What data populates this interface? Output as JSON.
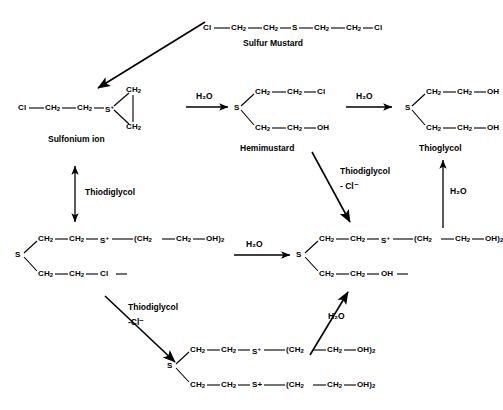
{
  "diagram": {
    "type": "reaction-scheme"
  },
  "species": {
    "sulfur_mustard": {
      "name": "Sulfur Mustard",
      "formula_line": "Cl—CH₂—CH₂—S—CH₂—CH₂—Cl",
      "atoms": [
        "Cl",
        "CH2",
        "CH2",
        "S",
        "CH2",
        "CH2",
        "Cl"
      ]
    },
    "sulfonium_ion": {
      "name": "Sulfonium ion",
      "chain": [
        "Cl",
        "CH2",
        "CH2",
        "S+"
      ],
      "ring": [
        "CH2",
        "CH2"
      ],
      "s_label": "S",
      "charge": "+"
    },
    "hemimustard": {
      "name": "Hemimustard",
      "center": "S",
      "top_branch": [
        "CH2",
        "CH2",
        "Cl"
      ],
      "bottom_branch": [
        "CH2",
        "CH2",
        "OH"
      ]
    },
    "thioglycol": {
      "name": "Thioglycol",
      "center": "S",
      "top_branch": [
        "CH2",
        "CH2",
        "OH"
      ],
      "bottom_branch": [
        "CH2",
        "CH2",
        "OH"
      ]
    },
    "chloro_sulfonium_adduct": {
      "name": "",
      "center": "S",
      "top_branch": [
        "CH2",
        "CH2",
        "S+",
        "(CH2",
        "CH2",
        "OH)2"
      ],
      "bottom_branch": [
        "CH2",
        "CH2",
        "Cl"
      ]
    },
    "hydroxy_sulfonium_adduct": {
      "name": "",
      "center": "S",
      "top_branch": [
        "CH2",
        "CH2",
        "S+",
        "(CH2",
        "CH2",
        "OH)2"
      ],
      "bottom_branch": [
        "CH2",
        "CH2",
        "OH"
      ]
    },
    "bis_sulfonium_adduct": {
      "name": "",
      "center": "S",
      "top_branch": [
        "CH2",
        "CH2",
        "S+",
        "(CH2",
        "CH2",
        "OH)2"
      ],
      "bottom_branch": [
        "CH2",
        "CH2",
        "S+",
        "(CH2",
        "CH2",
        "OH)2"
      ]
    }
  },
  "reagents": {
    "water": "H₂O",
    "thiodiglycol": "Thiodiglycol",
    "minus_chloride": "- Cl⁻",
    "minus_chloride_tight": "-Cl⁻"
  },
  "arrows": [
    {
      "id": "mustard-to-sulfonium",
      "label": "",
      "direction": "down-left",
      "style": "solid"
    },
    {
      "id": "sulfonium-to-hemimustard",
      "label": "H₂O",
      "direction": "right",
      "style": "solid"
    },
    {
      "id": "hemimustard-to-thioglycol",
      "label": "H₂O",
      "direction": "right",
      "style": "solid"
    },
    {
      "id": "sulfonium-to-chloro-adduct",
      "label": "Thiodiglycol",
      "direction": "vertical-double",
      "style": "solid"
    },
    {
      "id": "hemimustard-to-hydroxy-adduct",
      "label": "Thiodiglycol - Cl⁻",
      "direction": "down-right",
      "style": "solid"
    },
    {
      "id": "hydroxy-adduct-to-thioglycol",
      "label": "H₂O",
      "direction": "up",
      "style": "solid"
    },
    {
      "id": "chloro-adduct-to-hydroxy-adduct",
      "label": "H₂O",
      "direction": "right",
      "style": "solid"
    },
    {
      "id": "chloro-adduct-to-bis-adduct",
      "label": "Thiodiglycol -Cl⁻",
      "direction": "down-right",
      "style": "solid"
    },
    {
      "id": "bis-adduct-to-hydroxy-adduct",
      "label": "H₂O",
      "direction": "up-right",
      "style": "solid"
    }
  ],
  "glyphs": {
    "dash": "—",
    "plus": "+",
    "minus": "−",
    "sub2": "₂"
  },
  "colors": {
    "ink": "#000000",
    "background": "#ffffff"
  }
}
